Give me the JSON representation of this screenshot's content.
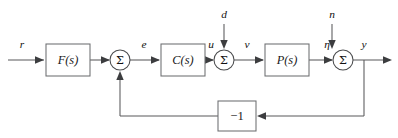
{
  "diagram": {
    "type": "control-block-diagram",
    "colors": {
      "background": "#ffffff",
      "line": "#58595b",
      "box_stroke": "#6d6e71",
      "text": "#1a1a1a",
      "arrowhead": "#3c3d3f"
    },
    "blocks": [
      {
        "id": "prefilter",
        "label": "F(s)",
        "x": 46,
        "y": 44,
        "w": 44,
        "h": 32
      },
      {
        "id": "controller",
        "label": "C(s)",
        "x": 161,
        "y": 44,
        "w": 44,
        "h": 32
      },
      {
        "id": "plant",
        "label": "P(s)",
        "x": 265,
        "y": 44,
        "w": 44,
        "h": 32
      },
      {
        "id": "feedback-gain",
        "label": "−1",
        "x": 218,
        "y": 101,
        "w": 38,
        "h": 30
      }
    ],
    "summing_junctions": [
      {
        "id": "sum-error",
        "symbol": "Σ",
        "cx": 120,
        "cy": 60,
        "r": 10
      },
      {
        "id": "sum-disturbance",
        "symbol": "Σ",
        "cx": 224,
        "cy": 60,
        "r": 10
      },
      {
        "id": "sum-noise",
        "symbol": "Σ",
        "cx": 343,
        "cy": 60,
        "r": 10
      }
    ],
    "signals": [
      {
        "id": "reference",
        "label": "r",
        "x": 22,
        "y": 45
      },
      {
        "id": "error",
        "label": "e",
        "x": 144,
        "y": 45
      },
      {
        "id": "control",
        "label": "u",
        "x": 211,
        "y": 45
      },
      {
        "id": "plant-input",
        "label": "v",
        "x": 247,
        "y": 45
      },
      {
        "id": "disturbance",
        "label": "d",
        "x": 224,
        "y": 15
      },
      {
        "id": "plant-output",
        "label": "η",
        "x": 327,
        "y": 45
      },
      {
        "id": "noise",
        "label": "n",
        "x": 332,
        "y": 15
      },
      {
        "id": "output",
        "label": "y",
        "x": 364,
        "y": 45
      }
    ]
  }
}
